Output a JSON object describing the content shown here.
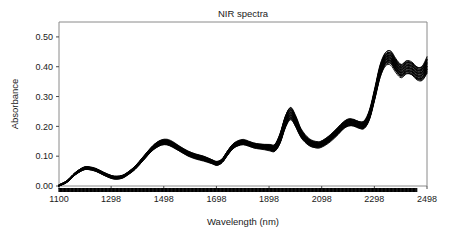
{
  "chart_data": {
    "type": "line",
    "title": "NIR spectra",
    "xlabel": "Wavelength (nm)",
    "ylabel": "Absorbance",
    "xlim": [
      1100,
      2498
    ],
    "ylim": [
      0.0,
      0.55
    ],
    "grid": false,
    "legend": "none",
    "xticks": [
      1100,
      1298,
      1498,
      1698,
      1898,
      2098,
      2298,
      2498
    ],
    "xtick_labels": [
      "1100",
      "1298",
      "1498",
      "1698",
      "1898",
      "2098",
      "2298",
      "2498"
    ],
    "yticks": [
      0.0,
      0.1,
      0.2,
      0.3,
      0.4,
      0.5
    ],
    "ytick_labels": [
      "0.00",
      "0.10",
      "0.20",
      "0.30",
      "0.40",
      "0.50"
    ],
    "line_color": "#000000",
    "n_series": 26,
    "x": [
      1100,
      1130,
      1160,
      1190,
      1210,
      1240,
      1270,
      1300,
      1320,
      1340,
      1360,
      1390,
      1420,
      1450,
      1470,
      1490,
      1510,
      1530,
      1560,
      1590,
      1620,
      1650,
      1680,
      1700,
      1720,
      1740,
      1760,
      1780,
      1800,
      1820,
      1840,
      1860,
      1880,
      1900,
      1920,
      1940,
      1960,
      1980,
      2000,
      2020,
      2050,
      2080,
      2100,
      2130,
      2160,
      2180,
      2200,
      2220,
      2240,
      2260,
      2280,
      2300,
      2320,
      2340,
      2360,
      2380,
      2400,
      2420,
      2440,
      2460,
      2480,
      2498
    ],
    "series": [
      {
        "name": "mean spectrum",
        "values": [
          0.002,
          0.015,
          0.04,
          0.057,
          0.06,
          0.054,
          0.041,
          0.03,
          0.028,
          0.031,
          0.041,
          0.062,
          0.092,
          0.122,
          0.137,
          0.146,
          0.147,
          0.14,
          0.124,
          0.109,
          0.099,
          0.092,
          0.082,
          0.076,
          0.085,
          0.11,
          0.132,
          0.143,
          0.147,
          0.142,
          0.136,
          0.133,
          0.131,
          0.129,
          0.128,
          0.16,
          0.215,
          0.243,
          0.215,
          0.176,
          0.147,
          0.138,
          0.142,
          0.16,
          0.185,
          0.203,
          0.213,
          0.212,
          0.205,
          0.206,
          0.24,
          0.31,
          0.385,
          0.425,
          0.43,
          0.404,
          0.386,
          0.398,
          0.394,
          0.378,
          0.378,
          0.405
        ]
      },
      {
        "name": "spread (min envelope)",
        "values": [
          0.0,
          0.012,
          0.036,
          0.053,
          0.056,
          0.05,
          0.037,
          0.026,
          0.024,
          0.027,
          0.037,
          0.057,
          0.086,
          0.115,
          0.129,
          0.138,
          0.139,
          0.132,
          0.117,
          0.102,
          0.092,
          0.085,
          0.076,
          0.07,
          0.079,
          0.103,
          0.125,
          0.136,
          0.14,
          0.135,
          0.129,
          0.126,
          0.124,
          0.12,
          0.118,
          0.145,
          0.196,
          0.223,
          0.198,
          0.163,
          0.137,
          0.129,
          0.133,
          0.15,
          0.174,
          0.192,
          0.202,
          0.201,
          0.194,
          0.194,
          0.226,
          0.294,
          0.367,
          0.406,
          0.41,
          0.384,
          0.366,
          0.377,
          0.373,
          0.357,
          0.356,
          0.38
        ]
      },
      {
        "name": "spread (max envelope)",
        "values": [
          0.004,
          0.018,
          0.044,
          0.062,
          0.065,
          0.059,
          0.046,
          0.035,
          0.033,
          0.036,
          0.046,
          0.068,
          0.099,
          0.13,
          0.146,
          0.155,
          0.156,
          0.149,
          0.132,
          0.117,
          0.107,
          0.1,
          0.089,
          0.083,
          0.092,
          0.118,
          0.141,
          0.152,
          0.156,
          0.15,
          0.144,
          0.141,
          0.14,
          0.14,
          0.141,
          0.178,
          0.236,
          0.264,
          0.233,
          0.19,
          0.158,
          0.148,
          0.152,
          0.171,
          0.197,
          0.215,
          0.226,
          0.224,
          0.217,
          0.219,
          0.256,
          0.328,
          0.405,
          0.446,
          0.452,
          0.426,
          0.408,
          0.421,
          0.417,
          0.401,
          0.403,
          0.432
        ]
      }
    ]
  },
  "axes": {
    "title": "NIR spectra",
    "x_axis_label": "Wavelength (nm)",
    "y_axis_label": "Absorbance"
  }
}
